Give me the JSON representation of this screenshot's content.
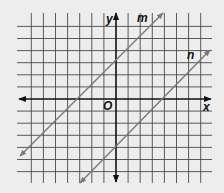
{
  "figure": {
    "type": "coordinate-plane",
    "background": "#ededed",
    "grid_color": "#4a4a4a",
    "axis_color": "#111111",
    "line_color": "#7a7a7a",
    "x_range": [
      -7,
      7
    ],
    "y_range": [
      -6,
      6
    ],
    "grid_step": 1
  },
  "labels": {
    "x_axis": "x",
    "y_axis": "y",
    "origin": "O"
  },
  "lines": [
    {
      "name": "m",
      "label": "m",
      "slope": 1,
      "y_intercept": 3,
      "equation": "y = x + 3"
    },
    {
      "name": "n",
      "label": "n",
      "slope": 1,
      "y_intercept": -4,
      "equation": "y = x - 4"
    }
  ]
}
